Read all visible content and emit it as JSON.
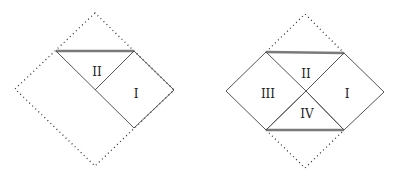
{
  "diagrams": [
    {
      "name": "left-penrose-diagram",
      "regions": [
        {
          "label": "II",
          "x": 97,
          "y": 72
        },
        {
          "label": "I",
          "x": 136,
          "y": 94
        }
      ]
    },
    {
      "name": "right-penrose-diagram",
      "regions": [
        {
          "label": "II",
          "x": 306,
          "y": 74
        },
        {
          "label": "III",
          "x": 268,
          "y": 94
        },
        {
          "label": "I",
          "x": 346,
          "y": 94
        },
        {
          "label": "IV",
          "x": 306,
          "y": 114
        }
      ]
    }
  ],
  "colors": {
    "line": "#555555",
    "singularity": "#7a7a7a",
    "dotted": "#333333"
  }
}
